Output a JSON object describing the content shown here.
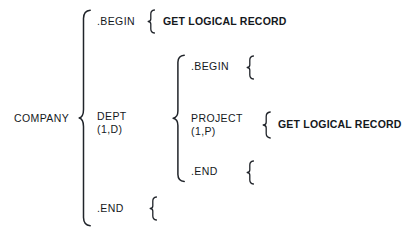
{
  "diagram": {
    "type": "hierarchical-structure-tree",
    "title": "",
    "background_color": "#ffffff",
    "ink_color": "#20242a",
    "width": 409,
    "height": 235,
    "root": {
      "label": "COMPANY",
      "children": [
        {
          "label": ".BEGIN",
          "children": [
            {
              "label": "GET LOGICAL RECORD",
              "emphasis": "bold",
              "children": []
            }
          ]
        },
        {
          "label": "DEPT",
          "occurrence": "(1,D)",
          "children": [
            {
              "label": ".BEGIN",
              "children": []
            },
            {
              "label": "PROJECT",
              "occurrence": "(1,P)",
              "children": [
                {
                  "label": "GET LOGICAL RECORD",
                  "emphasis": "bold",
                  "children": []
                }
              ]
            },
            {
              "label": ".END",
              "children": []
            }
          ]
        },
        {
          "label": ".END",
          "children": []
        }
      ]
    },
    "labels": {
      "company": "COMPANY",
      "level1_begin": ".BEGIN",
      "level1_dept": "DEPT",
      "level1_dept_occurrence": "(1,D)",
      "level1_end": ".END",
      "level2_begin": ".BEGIN",
      "level2_project": "PROJECT",
      "level2_project_occurrence": "(1,P)",
      "level2_end": ".END",
      "get_logical_record_1": "GET LOGICAL RECORD",
      "get_logical_record_2": "GET LOGICAL RECORD"
    },
    "braces": {
      "company_brace": "large-left-curly-brace",
      "dept_brace": "large-left-curly-brace",
      "begin1_brace": "small-left-curly-brace",
      "begin2_brace": "small-left-curly-brace",
      "project_brace": "small-left-curly-brace",
      "end2_brace": "small-left-curly-brace",
      "end1_brace": "small-left-curly-brace"
    }
  }
}
